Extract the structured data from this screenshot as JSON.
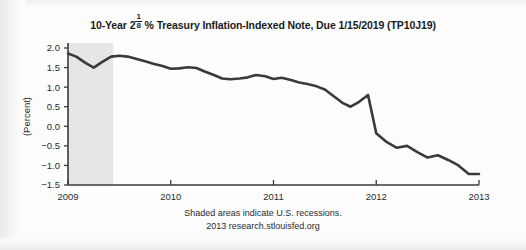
{
  "chart_data": {
    "type": "line",
    "title_parts": {
      "before": "10-Year 2",
      "frac_num": "1",
      "frac_den": "8",
      "after": " % Treasury Inflation-Indexed Note, Due 1/15/2019 (TP10J19)"
    },
    "xlabel": "",
    "ylabel": "(Percent)",
    "xlim": [
      2009.0,
      2013.0
    ],
    "ylim": [
      -1.5,
      2.0
    ],
    "xticks": [
      2009,
      2010,
      2011,
      2012,
      2013
    ],
    "xtick_labels": [
      "2009",
      "2010",
      "2011",
      "2012",
      "2013"
    ],
    "yticks": [
      2.0,
      1.5,
      1.0,
      0.5,
      0.0,
      -0.5,
      -1.0,
      -1.5
    ],
    "ytick_labels": [
      "2.0",
      "1.5",
      "1.0",
      "0.5",
      "0.0",
      "−0.5",
      "−1.0",
      "−1.5"
    ],
    "grid": false,
    "legend": "none",
    "line_color": "#3a3a3a",
    "line_width": 2.6,
    "shaded_regions": [
      {
        "label": "U.S. recession",
        "x_start": 2009.0,
        "x_end": 2009.44,
        "color": "#e6e6e6"
      }
    ],
    "series": [
      {
        "name": "10-Year Treasury Inflation-Indexed Note (TP10J19)",
        "x": [
          2009.0,
          2009.08,
          2009.17,
          2009.25,
          2009.33,
          2009.42,
          2009.5,
          2009.58,
          2009.67,
          2009.75,
          2009.83,
          2009.92,
          2010.0,
          2010.08,
          2010.17,
          2010.25,
          2010.33,
          2010.42,
          2010.5,
          2010.58,
          2010.67,
          2010.75,
          2010.83,
          2010.92,
          2011.0,
          2011.08,
          2011.17,
          2011.25,
          2011.33,
          2011.42,
          2011.5,
          2011.58,
          2011.67,
          2011.75,
          2011.83,
          2011.92,
          2012.0,
          2012.08,
          2012.17,
          2012.25,
          2012.33,
          2012.42,
          2012.5,
          2012.58,
          2012.67,
          2012.75,
          2012.83,
          2012.92,
          2013.0
        ],
        "values": [
          1.86,
          1.78,
          1.62,
          1.5,
          1.64,
          1.78,
          1.8,
          1.78,
          1.72,
          1.66,
          1.6,
          1.54,
          1.47,
          1.48,
          1.51,
          1.49,
          1.4,
          1.31,
          1.22,
          1.2,
          1.22,
          1.25,
          1.31,
          1.28,
          1.21,
          1.24,
          1.18,
          1.12,
          1.08,
          1.02,
          0.94,
          0.78,
          0.6,
          0.5,
          0.62,
          0.8,
          0.78,
          0.9,
          0.86,
          0.62,
          0.42,
          0.36,
          0.3,
          0.1,
          -0.02,
          0.08,
          0.0,
          -0.1,
          -0.18
        ]
      }
    ],
    "series_extension": {
      "note": "continuation of the single series to the right edge",
      "x": [
        2012.0,
        2012.1,
        2012.2,
        2012.3,
        2012.4,
        2012.5,
        2012.6,
        2012.7,
        2012.8,
        2012.9,
        2013.0
      ],
      "values": [
        -0.18,
        -0.4,
        -0.55,
        -0.5,
        -0.66,
        -0.8,
        -0.74,
        -0.86,
        -1.0,
        -1.22,
        -1.22
      ]
    },
    "annotations": [
      "Shaded areas indicate U.S. recessions.",
      "2013 research.stlouisfed.org"
    ]
  },
  "footnotes": {
    "recession": "Shaded areas indicate U.S. recessions.",
    "source": "2013 research.stlouisfed.org"
  }
}
